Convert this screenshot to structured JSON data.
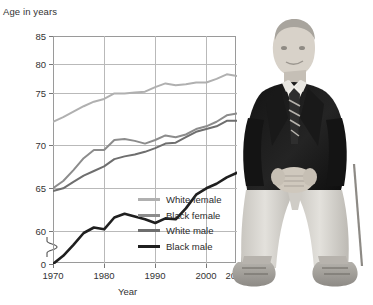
{
  "chart_data": {
    "type": "line",
    "title": "",
    "ylabel": "Age in years",
    "xlabel": "Year",
    "xlim": [
      1970,
      2006
    ],
    "ylim": [
      60,
      85
    ],
    "y_axis_break": true,
    "y_break_from": 0,
    "y_break_to": 60,
    "yticks": [
      "0",
      "60",
      "65",
      "70",
      "75",
      "80",
      "85"
    ],
    "xticks": [
      "1970",
      "1980",
      "1990",
      "2000",
      "2006"
    ],
    "grid": true,
    "legend_position": "inside-bottom-right",
    "x": [
      1970,
      1972,
      1974,
      1976,
      1978,
      1980,
      1982,
      1984,
      1986,
      1988,
      1990,
      1992,
      1994,
      1996,
      1998,
      2000,
      2002,
      2004,
      2006
    ],
    "series": [
      {
        "name": "White female",
        "color": "#b0b0b0",
        "values": [
          75.6,
          76.1,
          76.7,
          77.3,
          77.8,
          78.1,
          78.7,
          78.7,
          78.8,
          78.9,
          79.4,
          79.8,
          79.6,
          79.7,
          79.9,
          79.9,
          80.3,
          80.8,
          80.6
        ]
      },
      {
        "name": "Black female",
        "color": "#8c8c8c",
        "values": [
          68.3,
          69.1,
          70.3,
          71.6,
          72.5,
          72.5,
          73.6,
          73.7,
          73.5,
          73.2,
          73.6,
          74.1,
          73.9,
          74.2,
          74.8,
          75.1,
          75.6,
          76.3,
          76.5
        ]
      },
      {
        "name": "White male",
        "color": "#6e6e6e",
        "values": [
          68.0,
          68.3,
          69.0,
          69.7,
          70.2,
          70.7,
          71.5,
          71.8,
          72.0,
          72.3,
          72.7,
          73.2,
          73.3,
          73.9,
          74.5,
          74.8,
          75.1,
          75.7,
          75.7
        ]
      },
      {
        "name": "Black male",
        "color": "#1f1f1f",
        "values": [
          60.0,
          60.9,
          62.1,
          63.4,
          64.0,
          63.8,
          65.1,
          65.5,
          65.2,
          64.9,
          64.5,
          65.0,
          64.9,
          66.1,
          67.6,
          68.3,
          68.8,
          69.5,
          70.0
        ]
      }
    ]
  },
  "photo": {
    "alt_name": "elderly-man-seated-photo",
    "description": "Black and white photograph of an elderly man in a dark blazer, striped tie and light trousers seated with hands clasped"
  }
}
